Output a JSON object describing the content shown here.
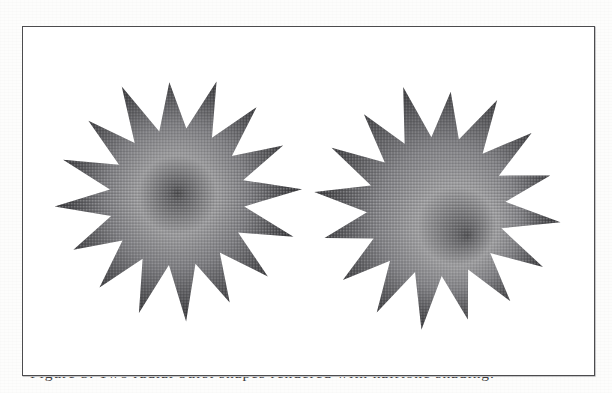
{
  "page": {
    "background_color": "#fdfdfc",
    "width": 612,
    "height": 393
  },
  "figure": {
    "frame": {
      "border_color": "#4c4c4e",
      "fill_color": "#ffffff",
      "x": 22,
      "y": 26,
      "width": 573,
      "height": 350
    },
    "caption": {
      "text": "Figure 3.  Two radial burst shapes rendered with halftone shading.",
      "clipped": true
    },
    "shapes": [
      {
        "name": "left-starburst",
        "label": "Left starburst",
        "points": 16,
        "center_x": 177,
        "center_y": 198,
        "outer_radius": 121,
        "inner_radius": 69,
        "rotation_deg": -4,
        "gradient": {
          "type": "radial",
          "focal_x": 177,
          "focal_y": 193,
          "core_color": "#4a4a4c",
          "mid_color": "#9a9a9c",
          "edge_color": "#3e3e41",
          "stops": [
            0,
            0.07,
            0.34,
            0.62,
            1.0
          ]
        }
      },
      {
        "name": "right-starburst",
        "label": "Right starburst",
        "points": 16,
        "center_x": 437,
        "center_y": 207,
        "outer_radius": 121,
        "inner_radius": 70,
        "rotation_deg": 7,
        "gradient": {
          "type": "radial",
          "focal_x": 468,
          "focal_y": 236,
          "core_color": "#4f4f52",
          "mid_color": "#9d9d9f",
          "edge_color": "#414144",
          "stops": [
            0,
            0.07,
            0.34,
            0.62,
            1.0
          ]
        }
      }
    ]
  }
}
